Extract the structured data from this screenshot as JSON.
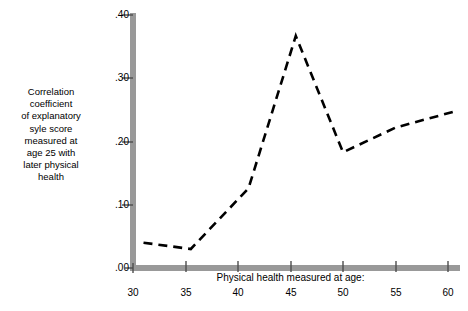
{
  "figure": {
    "y_axis_label": "Correlation\ncoefficient\nof explanatory\nsyle score\nmeasured at\nage 25 with\nlater physical\nhealth",
    "x_axis_title": "Physical health measured at age:",
    "axis_color": "#999999",
    "line_color": "#000000",
    "background_color": "#ffffff"
  },
  "chart_data": {
    "type": "line",
    "title": "",
    "subtitle": "",
    "xlabel": "Physical health measured at age:",
    "ylabel": "Correlation coefficient of explanatory syle score measured at age 25 with later physical health",
    "xlim": [
      30,
      61
    ],
    "ylim": [
      0.0,
      0.4
    ],
    "grid": false,
    "legend": null,
    "line_style": "dashed",
    "xticks": [
      30,
      35,
      40,
      45,
      50,
      55,
      60
    ],
    "xtick_labels": [
      "30",
      "35",
      "40",
      "45",
      "50",
      "55",
      "60"
    ],
    "yticks": [
      0.0,
      0.1,
      0.2,
      0.3,
      0.4
    ],
    "ytick_labels": [
      ".00",
      ".10",
      ".20",
      ".30",
      ".40"
    ],
    "x": [
      31.0,
      35.5,
      41.0,
      45.5,
      50.0,
      55.0,
      60.5
    ],
    "values": [
      0.04,
      0.03,
      0.126,
      0.367,
      0.183,
      0.222,
      0.247
    ],
    "series": [
      {
        "name": "Correlation coefficient",
        "x": [
          31.0,
          35.5,
          41.0,
          45.5,
          50.0,
          55.0,
          60.5
        ],
        "values": [
          0.04,
          0.03,
          0.126,
          0.367,
          0.183,
          0.222,
          0.247
        ]
      }
    ],
    "annotations": []
  }
}
